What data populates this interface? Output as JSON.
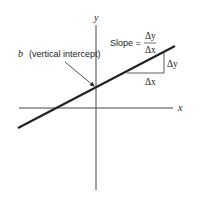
{
  "diagram": {
    "axes": {
      "x_label": "x",
      "y_label": "y"
    },
    "intercept_label": {
      "symbol": "b",
      "text": "(vertical intercept)"
    },
    "slope": {
      "label": "Slope =",
      "numerator": "Δy",
      "denominator": "Δx"
    },
    "triangle": {
      "rise_label": "Δy",
      "run_label": "Δx"
    },
    "colors": {
      "line": "#222222",
      "axes": "#333333"
    }
  }
}
